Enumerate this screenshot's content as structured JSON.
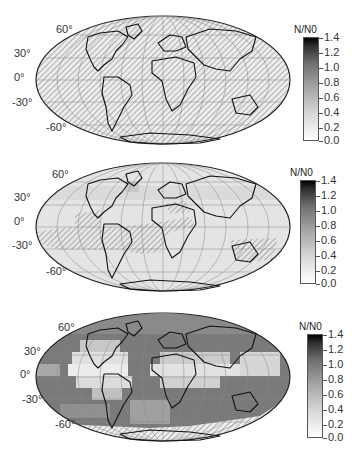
{
  "panels": [
    {
      "id": "top",
      "description": "Mollweide global map, nearly all hatched (no data), light gray",
      "latitude_labels": [
        "60°",
        "30°",
        "0°",
        "-30°",
        "-60°"
      ],
      "colorbar": {
        "title": "N/N0",
        "ticks": [
          "1.4",
          "1.2",
          "1.0",
          "0.8",
          "0.6",
          "0.4",
          "0.2",
          "0.0"
        ]
      }
    },
    {
      "id": "middle",
      "description": "Mollweide global map, mostly light gray (~0.2), hatched regions in tropical South Atlantic/South America and Australia",
      "latitude_labels": [
        "60°",
        "30°",
        "0°",
        "-30°",
        "-60°"
      ],
      "colorbar": {
        "title": "N/N0",
        "ticks": [
          "1.4",
          "1.2",
          "1.0",
          "0.8",
          "0.6",
          "0.4",
          "0.2",
          "0.0"
        ]
      }
    },
    {
      "id": "bottom",
      "description": "Mollweide global map, gridded gray cells ~0.8-1.0 with lighter tropical bands, hatched near Antarctica edge",
      "latitude_labels": [
        "60°",
        "30°",
        "0°",
        "-30°",
        "-60°"
      ],
      "colorbar": {
        "title": "N/N0",
        "ticks": [
          "1.4",
          "1.2",
          "1.0",
          "0.8",
          "0.6",
          "0.4",
          "0.2",
          "0.0"
        ]
      }
    }
  ],
  "colors": {
    "land_outline": "#111111",
    "hatch": "#555555",
    "grid": "#888888",
    "map_low": "#e6e6e6",
    "map_high": "#5a5a5a"
  }
}
